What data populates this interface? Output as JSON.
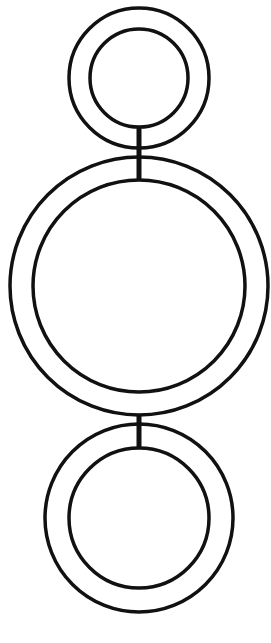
{
  "diagram": {
    "stroke_color": "#111111",
    "background": "#ffffff",
    "nodes": [
      {
        "id": "top",
        "cx": 139,
        "cy": 78,
        "outer_r": 70,
        "inner_r": 49
      },
      {
        "id": "middle",
        "cx": 139,
        "cy": 286,
        "outer_r": 129,
        "inner_r": 106
      },
      {
        "id": "bottom",
        "cx": 139,
        "cy": 518,
        "outer_r": 94,
        "inner_r": 70
      }
    ],
    "connectors": [
      {
        "from": "top",
        "to": "middle",
        "x": 139,
        "y1": 127,
        "y2": 180
      },
      {
        "from": "middle",
        "to": "bottom",
        "x": 139,
        "y1": 415,
        "y2": 448
      }
    ]
  }
}
